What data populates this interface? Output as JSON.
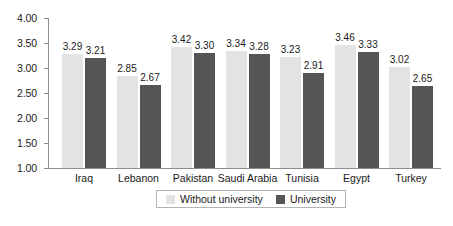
{
  "chart_data": {
    "type": "bar",
    "title": "",
    "subtitle": "",
    "xlabel": "",
    "ylabel": "",
    "ylim": [
      1.0,
      4.0
    ],
    "ytick_labels": [
      "4.00",
      "3.50",
      "3.00",
      "2.50",
      "2.00",
      "1.50",
      "1.00"
    ],
    "ytick_values": [
      4.0,
      3.5,
      3.0,
      2.5,
      2.0,
      1.5,
      1.0
    ],
    "grid": false,
    "legend_position": "bottom-center",
    "categories": [
      "Iraq",
      "Lebanon",
      "Pakistan",
      "Saudi Arabia",
      "Tunisia",
      "Egypt",
      "Turkey"
    ],
    "series": [
      {
        "name": "Without university",
        "color": "#e3e3e3",
        "values": [
          3.29,
          2.85,
          3.42,
          3.34,
          3.23,
          3.46,
          3.02
        ],
        "labels": [
          "3.29",
          "2.85",
          "3.42",
          "3.34",
          "3.23",
          "3.46",
          "3.02"
        ]
      },
      {
        "name": "University",
        "color": "#555555",
        "values": [
          3.21,
          2.67,
          3.3,
          3.28,
          2.91,
          3.33,
          2.65
        ],
        "labels": [
          "3.21",
          "2.67",
          "3.30",
          "3.28",
          "2.91",
          "3.33",
          "2.65"
        ]
      }
    ]
  },
  "legend": {
    "items": [
      {
        "label": "Without university",
        "color": "#e3e3e3"
      },
      {
        "label": "University",
        "color": "#555555"
      }
    ]
  },
  "colors": {
    "axis": "#8d8d8d",
    "text": "#1a1a1a",
    "background": "#ffffff",
    "legend_border": "#b4b4b4"
  }
}
